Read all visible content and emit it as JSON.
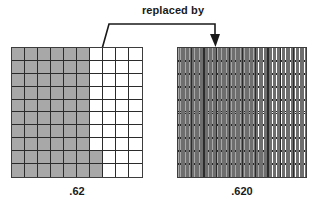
{
  "figure": {
    "connector": {
      "label": "replaced by",
      "arrow_direction": "down-right",
      "style": "bracket-with-arrowhead"
    },
    "left_model": {
      "value_label": ".62",
      "columns": 10,
      "rows": 10,
      "unit_name": "hundredths-square",
      "shaded_count": 62,
      "total_count": 100,
      "shaded_color": "#a8a8a8",
      "unshaded_color": "#ffffff",
      "line_color": "#2b2b2b",
      "shaded_per_row": [
        6,
        6,
        6,
        6,
        6,
        6,
        6,
        6,
        7,
        7
      ]
    },
    "right_model": {
      "value_label": ".620",
      "columns": 10,
      "rows": 10,
      "strips_per_cell": 10,
      "unit_name": "thousandths-strip",
      "shaded_count": 620,
      "total_count": 1000,
      "shaded_color": "#a8a8a8",
      "unshaded_color": "#ffffff",
      "line_color": "#2b2b2b",
      "strip_line_color": "#6e6e6e",
      "shaded_per_row": [
        6,
        6,
        6,
        6,
        6,
        6,
        6,
        6,
        7,
        7
      ]
    }
  },
  "chart_data": {
    "type": "table",
    "categories": [
      ".62",
      ".620"
    ],
    "values": [
      62,
      620
    ],
    "series": [
      {
        "name": "shaded units",
        "values": [
          62,
          620
        ]
      },
      {
        "name": "total units",
        "values": [
          100,
          1000
        ]
      }
    ],
    "xlabel": "decimal model",
    "ylabel": "shaded units",
    "annotations": [
      "replaced by"
    ]
  }
}
